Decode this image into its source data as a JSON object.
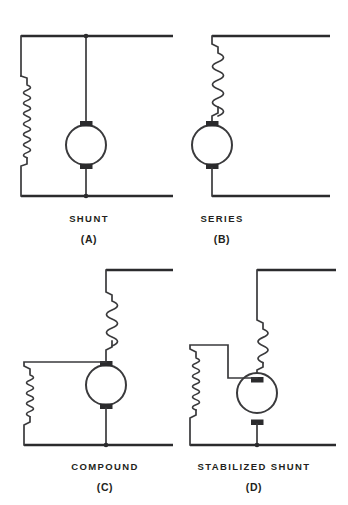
{
  "figure": {
    "background_color": "#ffffff",
    "line_color": "#3a3a3c",
    "text_color": "#231f20",
    "width": 348,
    "height": 505
  },
  "panels": [
    {
      "id": "a",
      "caption": "SHUNT",
      "letter": "(A)",
      "field_windings": [
        "shunt"
      ],
      "symbols": [
        "armature",
        "shunt-field-coil",
        "supply-line-top",
        "supply-line-bottom"
      ],
      "description": "Shunt field coil connected in parallel across the armature between the two supply lines"
    },
    {
      "id": "b",
      "caption": "SERIES",
      "letter": "(B)",
      "field_windings": [
        "series"
      ],
      "symbols": [
        "armature",
        "series-field-coil",
        "supply-line-top",
        "supply-line-bottom"
      ],
      "description": "Series field coil connected in series with the armature"
    },
    {
      "id": "c",
      "caption": "COMPOUND",
      "letter": "(C)",
      "field_windings": [
        "series",
        "shunt"
      ],
      "symbols": [
        "armature",
        "series-field-coil",
        "shunt-field-coil",
        "supply-line-top",
        "supply-line-bottom"
      ],
      "description": "Series field coil in series with the armature plus a shunt field coil in parallel"
    },
    {
      "id": "d",
      "caption": "STABILIZED SHUNT",
      "letter": "(D)",
      "field_windings": [
        "series",
        "shunt"
      ],
      "symbols": [
        "armature",
        "series-field-coil",
        "shunt-field-coil",
        "supply-line-top",
        "supply-line-bottom"
      ],
      "description": "Shunt field coil with a light stabilizing series field coil"
    }
  ]
}
